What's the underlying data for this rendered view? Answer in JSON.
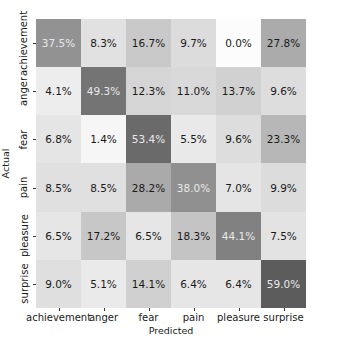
{
  "chart_data": {
    "type": "heatmap",
    "title": "",
    "xlabel": "Predicted",
    "ylabel": "Actual",
    "x_categories": [
      "achievement",
      "anger",
      "fear",
      "pain",
      "pleasure",
      "surprise"
    ],
    "y_categories": [
      "achievement",
      "anger",
      "fear",
      "pain",
      "pleasure",
      "surprise"
    ],
    "values": [
      [
        37.5,
        8.3,
        16.7,
        9.7,
        0.0,
        27.8
      ],
      [
        4.1,
        49.3,
        12.3,
        11.0,
        13.7,
        9.6
      ],
      [
        6.8,
        1.4,
        53.4,
        5.5,
        9.6,
        23.3
      ],
      [
        8.5,
        8.5,
        28.2,
        38.0,
        7.0,
        9.9
      ],
      [
        6.5,
        17.2,
        6.5,
        18.3,
        44.1,
        7.5
      ],
      [
        9.0,
        5.1,
        14.1,
        6.4,
        6.4,
        59.0
      ]
    ],
    "value_format": "percent_1dp",
    "colormap": "greys",
    "vmin": 0,
    "vmax": 59.0,
    "grid": false,
    "legend": "none"
  }
}
